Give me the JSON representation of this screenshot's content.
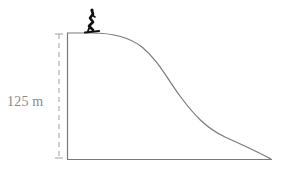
{
  "diagram": {
    "height_label": "125 m",
    "colors": {
      "line": "#7a7a7a",
      "dashed": "#a0a0a0",
      "text": "#8a8a8a",
      "skier": "#111111"
    },
    "icons": {
      "skier": "skier-icon"
    }
  }
}
